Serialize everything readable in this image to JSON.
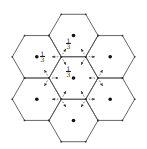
{
  "diagram": {
    "hex_side": 24.5,
    "line_color": "#555555",
    "dot_color": "#111111",
    "arrow_color": "#333333",
    "cells": [
      {
        "name": "center",
        "cx": 73.5,
        "cy": 78
      },
      {
        "name": "top",
        "cx": 73.5,
        "cy": 35.5
      },
      {
        "name": "bottom",
        "cx": 73.5,
        "cy": 120.5
      },
      {
        "name": "upper-left",
        "cx": 36.8,
        "cy": 56.8
      },
      {
        "name": "upper-right",
        "cx": 110.2,
        "cy": 56.8
      },
      {
        "name": "lower-left",
        "cx": 36.8,
        "cy": 99.2
      },
      {
        "name": "lower-right",
        "cx": 110.2,
        "cy": 99.2
      }
    ],
    "labels": [
      {
        "num": "1",
        "den": "3",
        "x": 66,
        "y": 38
      },
      {
        "num": "1",
        "den": "3",
        "x": 40,
        "y": 51
      },
      {
        "num": "1",
        "den": "3",
        "x": 66,
        "y": 66
      }
    ]
  }
}
